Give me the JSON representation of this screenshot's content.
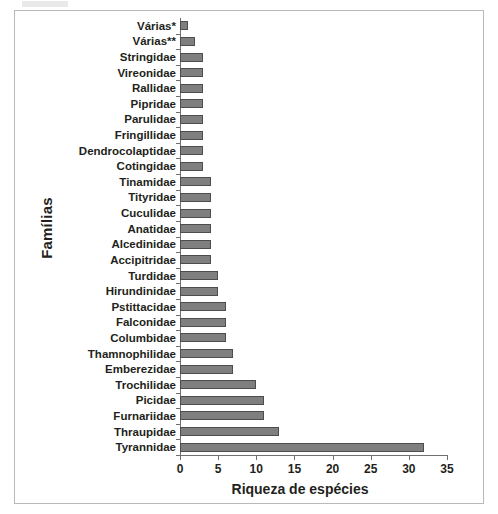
{
  "chart_data": {
    "type": "bar",
    "orientation": "horizontal",
    "title": "",
    "xlabel": "Riqueza de espécies",
    "ylabel": "Famílias",
    "xlim": [
      0,
      35
    ],
    "xticks": [
      0,
      5,
      10,
      15,
      20,
      25,
      30,
      35
    ],
    "grid": false,
    "legend": null,
    "bar_color": "#7f7f7f",
    "bar_edge_color": "#4d4d4d",
    "axis_color": "#6f6f6f",
    "categories": [
      "Várias*",
      "Várias**",
      "Stringidae",
      "Vireonidae",
      "Rallidae",
      "Pipridae",
      "Parulidae",
      "Fringillidae",
      "Dendrocolaptidae",
      "Cotingidae",
      "Tinamidae",
      "Tityridae",
      "Cuculidae",
      "Anatidae",
      "Alcedinidae",
      "Accipitridae",
      "Turdidae",
      "Hirundinidae",
      "Pstittacidae",
      "Falconidae",
      "Columbidae",
      "Thamnophilidae",
      "Emberezidae",
      "Trochilidae",
      "Picidae",
      "Furnariidae",
      "Thraupidae",
      "Tyrannidae"
    ],
    "values": [
      1,
      2,
      3,
      3,
      3,
      3,
      3,
      3,
      3,
      3,
      4,
      4,
      4,
      4,
      4,
      4,
      5,
      5,
      6,
      6,
      6,
      7,
      7,
      10,
      11,
      11,
      13,
      32
    ]
  }
}
